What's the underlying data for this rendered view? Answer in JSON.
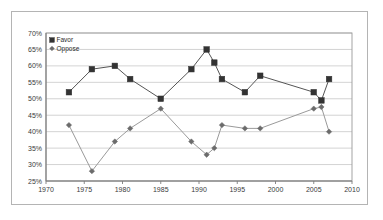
{
  "chart_data": {
    "type": "line",
    "title": "",
    "xlabel": "",
    "ylabel": "",
    "xlim": [
      1970,
      2010
    ],
    "ylim": [
      25,
      70
    ],
    "xticks": [
      1970,
      1975,
      1980,
      1985,
      1990,
      1995,
      2000,
      2005,
      2010
    ],
    "xtick_labels": [
      "1970",
      "1975",
      "1980",
      "1985",
      "1990",
      "1995",
      "2000",
      "2005",
      "2010"
    ],
    "yticks": [
      25,
      30,
      35,
      40,
      45,
      50,
      55,
      60,
      65,
      70
    ],
    "ytick_labels": [
      "25%",
      "30%",
      "35%",
      "40%",
      "45%",
      "50%",
      "55%",
      "60%",
      "65%",
      "70%"
    ],
    "grid": "horizontal",
    "legend_position": "top-left",
    "series": [
      {
        "name": "Favor",
        "marker": "square",
        "color": "#333333",
        "line_color": "#555555",
        "x": [
          1973,
          1976,
          1979,
          1981,
          1985,
          1989,
          1991,
          1992,
          1993,
          1996,
          1998,
          2005,
          2006,
          2007
        ],
        "values": [
          52,
          59,
          60,
          56,
          50,
          59,
          65,
          61,
          56,
          52,
          57,
          52,
          49.5,
          56
        ]
      },
      {
        "name": "Oppose",
        "marker": "diamond",
        "color": "#6b6b6b",
        "line_color": "#9a9a9a",
        "x": [
          1973,
          1976,
          1979,
          1981,
          1985,
          1989,
          1991,
          1992,
          1993,
          1996,
          1998,
          2005,
          2006,
          2007
        ],
        "values": [
          42,
          28,
          37,
          41,
          47,
          37,
          33,
          35,
          42,
          41,
          41,
          47,
          47.5,
          40
        ]
      }
    ]
  },
  "legend": {
    "items": [
      {
        "label": "Favor",
        "marker": "square",
        "color": "#333333"
      },
      {
        "label": "Oppose",
        "marker": "diamond",
        "color": "#6b6b6b"
      }
    ]
  },
  "axes": {
    "x_tick_labels": [
      "1970",
      "1975",
      "1980",
      "1985",
      "1990",
      "1995",
      "2000",
      "2005",
      "2010"
    ],
    "y_tick_labels": [
      "25%",
      "30%",
      "35%",
      "40%",
      "45%",
      "50%",
      "55%",
      "60%",
      "65%",
      "70%"
    ]
  },
  "style": {
    "frame_color": "#b4b4b4",
    "grid_color": "#c8c8c8",
    "plot_border_color": "#9a9a9a",
    "background": "#ffffff"
  }
}
